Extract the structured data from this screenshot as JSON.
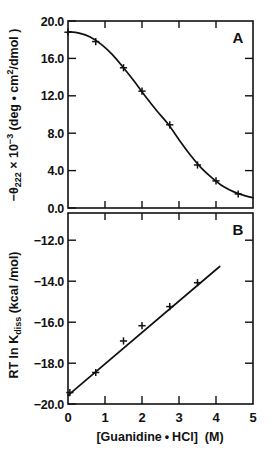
{
  "figure": {
    "panel_a_letter": "A",
    "panel_b_letter": "B"
  },
  "axes": {
    "x_label_main": "[Guanidine",
    "x_label_dot": "•",
    "x_label_acid": "HCl]",
    "x_label_unit": "(M)",
    "x_label_full": "[Guanidine • HCl]  (M)",
    "x_ticks": [
      "0",
      "1",
      "2",
      "3",
      "4",
      "5"
    ],
    "panel_a_y_label_prefix": "−θ",
    "panel_a_y_label_sub": "222",
    "panel_a_y_label_mid": " × 10",
    "panel_a_y_label_sup": "−3",
    "panel_a_y_label_units": " (deg • cm",
    "panel_a_y_label_units_sup": "2",
    "panel_a_y_label_units_end": "/dmol )",
    "panel_a_y_label_full": "−θ222 × 10−3 (deg • cm2/dmol )",
    "panel_a_y_ticks": [
      "20.0",
      "16.0",
      "12.0",
      "8.0",
      "4.0",
      "0.0"
    ],
    "panel_b_y_label_prefix": "RT ln K",
    "panel_b_y_label_sub": "diss",
    "panel_b_y_label_units": " (kcal /mol)",
    "panel_b_y_label_full": "RT ln Kdiss (kcal /mol)",
    "panel_b_y_ticks": [
      "−12.0",
      "−14.0",
      "−16.0",
      "−18.0",
      "−20.0"
    ]
  },
  "chart_data": [
    {
      "type": "line",
      "id": "panel-a",
      "title": "A",
      "xlabel": "[Guanidine • HCl] (M)",
      "ylabel": "−θ222 × 10−3 (deg • cm2/dmol)",
      "xlim": [
        0,
        5
      ],
      "ylim": [
        0,
        20
      ],
      "xticks": [
        0,
        1,
        2,
        3,
        4,
        5
      ],
      "yticks": [
        0,
        4,
        8,
        12,
        16,
        20
      ],
      "grid": false,
      "legend": false,
      "marker": "plus",
      "points": [
        {
          "x": 0.0,
          "y": 18.8
        },
        {
          "x": 0.75,
          "y": 17.8
        },
        {
          "x": 1.5,
          "y": 15.0
        },
        {
          "x": 2.0,
          "y": 12.5
        },
        {
          "x": 2.75,
          "y": 8.9
        },
        {
          "x": 3.5,
          "y": 4.6
        },
        {
          "x": 4.0,
          "y": 2.9
        },
        {
          "x": 4.6,
          "y": 1.5
        }
      ],
      "curve": [
        {
          "x": 0.0,
          "y": 18.85
        },
        {
          "x": 0.3,
          "y": 18.7
        },
        {
          "x": 0.6,
          "y": 18.3
        },
        {
          "x": 0.9,
          "y": 17.5
        },
        {
          "x": 1.2,
          "y": 16.4
        },
        {
          "x": 1.5,
          "y": 15.0
        },
        {
          "x": 1.8,
          "y": 13.5
        },
        {
          "x": 2.1,
          "y": 11.9
        },
        {
          "x": 2.4,
          "y": 10.4
        },
        {
          "x": 2.7,
          "y": 9.0
        },
        {
          "x": 3.0,
          "y": 7.3
        },
        {
          "x": 3.3,
          "y": 5.7
        },
        {
          "x": 3.6,
          "y": 4.3
        },
        {
          "x": 3.9,
          "y": 3.2
        },
        {
          "x": 4.2,
          "y": 2.3
        },
        {
          "x": 4.5,
          "y": 1.7
        },
        {
          "x": 4.8,
          "y": 1.3
        },
        {
          "x": 5.0,
          "y": 1.1
        }
      ]
    },
    {
      "type": "scatter",
      "id": "panel-b",
      "title": "B",
      "xlabel": "[Guanidine • HCl] (M)",
      "ylabel": "RT ln Kdiss (kcal /mol)",
      "xlim": [
        0,
        5
      ],
      "ylim": [
        -20.6,
        -10.6
      ],
      "xticks": [
        0,
        1,
        2,
        3,
        4,
        5
      ],
      "yticks": [
        -12,
        -14,
        -16,
        -18,
        -20
      ],
      "grid": false,
      "legend": false,
      "marker": "plus",
      "points": [
        {
          "x": 0.05,
          "y": -20.0
        },
        {
          "x": 0.75,
          "y": -18.95
        },
        {
          "x": 1.5,
          "y": -17.3
        },
        {
          "x": 2.0,
          "y": -16.5
        },
        {
          "x": 2.75,
          "y": -15.5
        },
        {
          "x": 3.5,
          "y": -14.25
        }
      ],
      "fit_line": {
        "x_start": 0.0,
        "y_start": -20.15,
        "x_end": 4.1,
        "y_end": -13.4
      }
    }
  ]
}
